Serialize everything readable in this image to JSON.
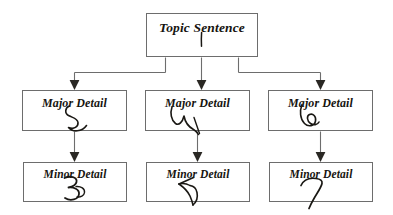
{
  "diagram": {
    "type": "hierarchy-tree",
    "background_color": "#ffffff",
    "box_border_color": "#6d6d6d",
    "text_color": "#16140f",
    "ink_color": "#1a1814",
    "levels": 3,
    "nodes": {
      "topic": {
        "label": "Topic Sentence",
        "annotation": "1",
        "annotation_kind": "handwritten-stroke"
      },
      "major": [
        {
          "label": "Major Detail",
          "annotation_kind": "handwritten-squiggle"
        },
        {
          "label": "Major Detail",
          "annotation_kind": "handwritten-squiggle"
        },
        {
          "label": "Major Detail",
          "annotation_kind": "handwritten-loop"
        }
      ],
      "minor": [
        {
          "label": "Minor Detail",
          "annotation_kind": "handwritten-three"
        },
        {
          "label": "Minor Detail",
          "annotation_kind": "handwritten-arrow"
        },
        {
          "label": "Minor Detail",
          "annotation_kind": "handwritten-seven"
        }
      ]
    },
    "connectors": {
      "style": "orthogonal-elbow-with-arrowheads",
      "from_topic_to_major": 3,
      "from_major_to_minor": 3,
      "arrowhead_color": "#2a2824"
    }
  }
}
